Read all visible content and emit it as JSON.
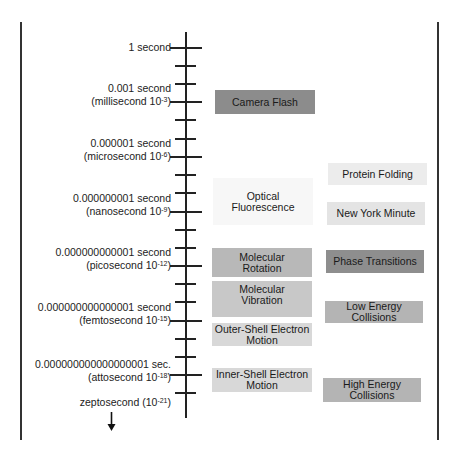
{
  "timeline": {
    "labels": [
      {
        "line1": "1 second",
        "line2": "",
        "exp": ""
      },
      {
        "line1": "0.001 second",
        "line2": "(millisecond 10",
        "exp": "-3"
      },
      {
        "line1": "0.000001 second",
        "line2": "(microsecond 10",
        "exp": "-6"
      },
      {
        "line1": "0.000000001 second",
        "line2": "(nanosecond 10",
        "exp": "-9"
      },
      {
        "line1": "0.000000000001 second",
        "line2": "(picosecond 10",
        "exp": "-12"
      },
      {
        "line1": "0.000000000000001 second",
        "line2": "(femtosecond 10",
        "exp": "-15"
      },
      {
        "line1": "0.000000000000000001 sec.",
        "line2": "(attosecond 10",
        "exp": "-18"
      }
    ],
    "zepto": {
      "text": "zeptosecond (10",
      "exp": "-21",
      "close": ")"
    },
    "arrow_icon": "down-arrow"
  },
  "events": {
    "left": [
      {
        "label": "Camera Flash",
        "color": "#8c8c8c"
      },
      {
        "label": "Optical Fluorescence",
        "color": "#f7f7f7"
      },
      {
        "label": "Molecular Rotation",
        "color": "#b8b8b8"
      },
      {
        "label": "Molecular Vibration",
        "color": "#c8c8c8"
      },
      {
        "label": "Outer-Shell Electron Motion",
        "color": "#d8d8d8"
      },
      {
        "label": "Inner-Shell Electron Motion",
        "color": "#d8d8d8"
      }
    ],
    "right": [
      {
        "label": "Protein Folding",
        "color": "#ececec"
      },
      {
        "label": "New York Minute",
        "color": "#e4e4e4"
      },
      {
        "label": "Phase Transitions",
        "color": "#8e8e8e"
      },
      {
        "label": "Low Energy Collisions",
        "color": "#b4b4b4"
      },
      {
        "label": "High Energy Collisions",
        "color": "#b4b4b4"
      }
    ]
  }
}
